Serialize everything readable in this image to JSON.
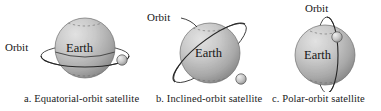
{
  "figure": {
    "background_color": "#ffffff",
    "panels": [
      {
        "id": "a",
        "caption": "a. Equatorial-orbit satellite",
        "orbit_label": "Orbit",
        "body_label": "Earth",
        "orbit_type": "equatorial",
        "orbit_inclination_deg": 0,
        "satellite_present": true,
        "satellite_position": "right",
        "sphere_color_light": "#d8d8d8",
        "sphere_color_dark": "#8d8d8d",
        "line_color": "#2b2b2b"
      },
      {
        "id": "b",
        "caption": "b. Inclined-orbit satellite",
        "orbit_label": "Orbit",
        "body_label": "Earth",
        "orbit_type": "inclined",
        "orbit_inclination_deg": 45,
        "satellite_present": true,
        "satellite_position": "lower-right",
        "sphere_color_light": "#d8d8d8",
        "sphere_color_dark": "#8d8d8d",
        "line_color": "#2b2b2b"
      },
      {
        "id": "c",
        "caption": "c. Polar-orbit satellite",
        "orbit_label": "Orbit",
        "body_label": "Earth",
        "orbit_type": "polar",
        "orbit_inclination_deg": 90,
        "satellite_present": true,
        "satellite_position": "upper-right",
        "sphere_color_light": "#d8d8d8",
        "sphere_color_dark": "#8d8d8d",
        "line_color": "#2b2b2b"
      }
    ]
  }
}
